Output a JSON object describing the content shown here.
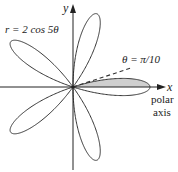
{
  "figure": {
    "equation_label": "r = 2 cos 5θ",
    "equation": {
      "a": 2,
      "k": 5,
      "func": "cos"
    },
    "y_axis_label": "y",
    "x_axis_label": "x",
    "polar_axis_label_line1": "polar",
    "polar_axis_label_line2": "axis",
    "ray_label": "θ = π/10",
    "ray_angle_fraction_of_pi": 0.1,
    "shaded_region": {
      "from_angle_fraction_of_pi": 0,
      "to_angle_fraction_of_pi": 0.1,
      "mirror": true
    },
    "colors": {
      "curve": "#333333",
      "axis": "#222222",
      "shade": "#cfcfcf",
      "dash": "#333333"
    }
  }
}
